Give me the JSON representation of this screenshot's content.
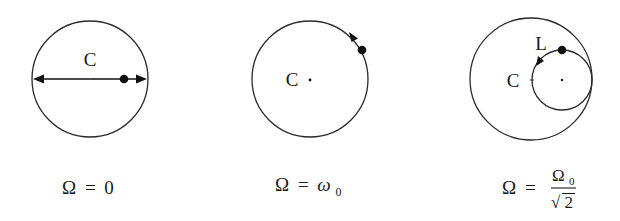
{
  "panels": [
    {
      "id": "panel-1",
      "center_label": "C",
      "caption": {
        "lhs": "Ω",
        "eq": "=",
        "rhs": "0"
      },
      "motion": "linear oscillation along diameter"
    },
    {
      "id": "panel-2",
      "center_label": "C",
      "caption": {
        "lhs": "Ω",
        "eq": "=",
        "rhs": "ω",
        "rhs_sub": "0"
      },
      "motion": "circular motion along outer circle"
    },
    {
      "id": "panel-3",
      "center_label": "C",
      "point_label": "L",
      "caption": {
        "lhs": "Ω",
        "eq": "=",
        "num": "Ω",
        "num_sub": "0",
        "den_root": "√",
        "den": "2"
      },
      "motion": "circular motion on inner tangent circle"
    }
  ],
  "colors": {
    "stroke": "#2a2a2a",
    "fill": "#111111",
    "background": "#ffffff"
  }
}
